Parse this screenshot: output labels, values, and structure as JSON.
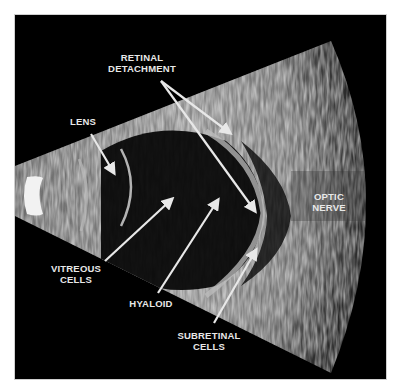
{
  "figure": {
    "type": "B-scan ocular ultrasound",
    "labels": {
      "retinal_detachment": {
        "line1": "RETINAL",
        "line2": "DETACHMENT"
      },
      "lens": {
        "line1": "LENS"
      },
      "optic_nerve": {
        "line1": "OPTIC",
        "line2": "NERVE"
      },
      "vitreous_cells": {
        "line1": "VITREOUS",
        "line2": "CELLS"
      },
      "hyaloid": {
        "line1": "HYALOID"
      },
      "subretinal_cells": {
        "line1": "SUBRETINAL",
        "line2": "CELLS"
      }
    },
    "colors": {
      "background": "#ffffff",
      "frame": "#000000",
      "annotation": "#e8e8e8"
    }
  }
}
